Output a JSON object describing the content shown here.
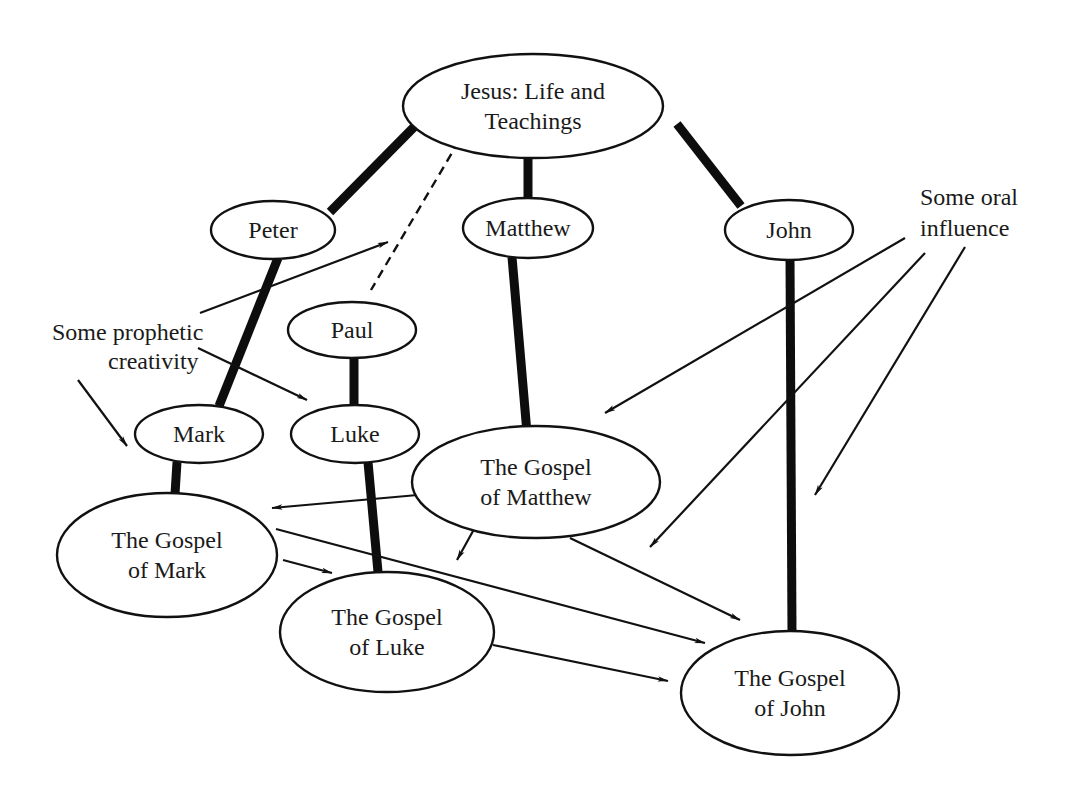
{
  "diagram": {
    "nodes": [
      {
        "id": "jesus",
        "lines": [
          "Jesus: Life and",
          "Teachings"
        ],
        "cx": 533,
        "cy": 106,
        "rx": 130,
        "ry": 52,
        "font": 24
      },
      {
        "id": "peter",
        "lines": [
          "Peter"
        ],
        "cx": 273,
        "cy": 230,
        "rx": 62,
        "ry": 29,
        "font": 24
      },
      {
        "id": "matthew",
        "lines": [
          "Matthew"
        ],
        "cx": 528,
        "cy": 228,
        "rx": 65,
        "ry": 30,
        "font": 24
      },
      {
        "id": "john",
        "lines": [
          "John"
        ],
        "cx": 789,
        "cy": 230,
        "rx": 64,
        "ry": 30,
        "font": 24
      },
      {
        "id": "paul",
        "lines": [
          "Paul"
        ],
        "cx": 352,
        "cy": 330,
        "rx": 64,
        "ry": 28,
        "font": 24
      },
      {
        "id": "mark",
        "lines": [
          "Mark"
        ],
        "cx": 199,
        "cy": 434,
        "rx": 64,
        "ry": 29,
        "font": 24
      },
      {
        "id": "luke",
        "lines": [
          "Luke"
        ],
        "cx": 355,
        "cy": 434,
        "rx": 64,
        "ry": 29,
        "font": 24
      },
      {
        "id": "gospel-matthew",
        "lines": [
          "The Gospel",
          "of Matthew"
        ],
        "cx": 536,
        "cy": 482,
        "rx": 124,
        "ry": 56,
        "font": 24
      },
      {
        "id": "gospel-mark",
        "lines": [
          "The Gospel",
          "of Mark"
        ],
        "cx": 167,
        "cy": 555,
        "rx": 110,
        "ry": 62,
        "font": 24
      },
      {
        "id": "gospel-luke",
        "lines": [
          "The Gospel",
          "of Luke"
        ],
        "cx": 387,
        "cy": 632,
        "rx": 107,
        "ry": 60,
        "font": 24
      },
      {
        "id": "gospel-john",
        "lines": [
          "The Gospel",
          "of John"
        ],
        "cx": 790,
        "cy": 693,
        "rx": 109,
        "ry": 62,
        "font": 24
      }
    ],
    "annotations": [
      {
        "id": "prophetic-creativity",
        "lines": [
          "Some prophetic",
          "creativity"
        ],
        "x": 52,
        "y": 340,
        "line_height": 29,
        "font": 24,
        "anchor": "start",
        "indent": [
          0,
          56
        ]
      },
      {
        "id": "oral-influence",
        "lines": [
          "Some oral",
          "influence"
        ],
        "x": 920,
        "y": 205,
        "line_height": 31,
        "font": 24,
        "anchor": "start",
        "indent": [
          0,
          0
        ]
      }
    ],
    "thick_lines": [
      {
        "from": "jesus",
        "to": "peter",
        "x1": 417,
        "y1": 124,
        "x2": 330,
        "y2": 212
      },
      {
        "from": "jesus",
        "to": "matthew",
        "x1": 528,
        "y1": 156,
        "x2": 528,
        "y2": 198
      },
      {
        "from": "jesus",
        "to": "john",
        "x1": 677,
        "y1": 124,
        "x2": 741,
        "y2": 206
      },
      {
        "from": "peter",
        "to": "mark",
        "x1": 278,
        "y1": 258,
        "x2": 219,
        "y2": 406
      },
      {
        "from": "matthew",
        "to": "gospel-matthew",
        "x1": 512,
        "y1": 257,
        "x2": 527,
        "y2": 433
      },
      {
        "from": "john",
        "to": "gospel-john",
        "x1": 790,
        "y1": 258,
        "x2": 792,
        "y2": 632
      },
      {
        "from": "paul",
        "to": "luke",
        "x1": 354,
        "y1": 357,
        "x2": 354,
        "y2": 405
      },
      {
        "from": "mark",
        "to": "gospel-mark",
        "x1": 177,
        "y1": 462,
        "x2": 175,
        "y2": 494
      },
      {
        "from": "luke",
        "to": "gospel-luke",
        "x1": 368,
        "y1": 462,
        "x2": 378,
        "y2": 572
      }
    ],
    "dashed_lines": [
      {
        "from": "jesus",
        "to": "paul",
        "x1": 459,
        "y1": 141,
        "x2": 371,
        "y2": 290
      }
    ],
    "arrows": [
      {
        "from": "prophetic-creativity",
        "to": "near-peter",
        "x1": 200,
        "y1": 313,
        "x2": 388,
        "y2": 242
      },
      {
        "from": "prophetic-creativity",
        "to": "luke",
        "x1": 198,
        "y1": 348,
        "x2": 307,
        "y2": 400
      },
      {
        "from": "prophetic-creativity",
        "to": "mark",
        "x1": 78,
        "y1": 380,
        "x2": 127,
        "y2": 446
      },
      {
        "from": "gospel-matthew",
        "to": "gospel-mark",
        "x1": 440,
        "y1": 493,
        "x2": 272,
        "y2": 508
      },
      {
        "from": "gospel-matthew",
        "to": "gospel-luke",
        "x1": 478,
        "y1": 522,
        "x2": 457,
        "y2": 560
      },
      {
        "from": "gospel-matthew",
        "to": "gospel-john",
        "x1": 570,
        "y1": 538,
        "x2": 740,
        "y2": 620
      },
      {
        "from": "gospel-mark",
        "to": "gospel-john",
        "x1": 276,
        "y1": 529,
        "x2": 705,
        "y2": 643
      },
      {
        "from": "gospel-mark",
        "to": "gospel-luke",
        "x1": 283,
        "y1": 560,
        "x2": 332,
        "y2": 573
      },
      {
        "from": "gospel-luke",
        "to": "gospel-john",
        "x1": 493,
        "y1": 645,
        "x2": 668,
        "y2": 681
      },
      {
        "from": "oral-influence",
        "to": "gospel-matthew",
        "x1": 905,
        "y1": 238,
        "x2": 605,
        "y2": 413
      },
      {
        "from": "oral-influence",
        "to": "gospel-john-upper",
        "x1": 925,
        "y1": 253,
        "x2": 650,
        "y2": 547
      },
      {
        "from": "oral-influence",
        "to": "gospel-john-right",
        "x1": 965,
        "y1": 247,
        "x2": 815,
        "y2": 495
      }
    ]
  }
}
